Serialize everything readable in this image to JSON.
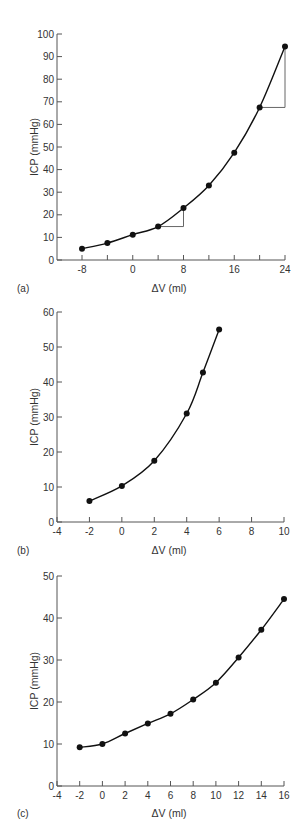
{
  "chart_data": [
    {
      "type": "line",
      "panel": "(a)",
      "title": "",
      "xlabel": "ΔV (ml)",
      "ylabel": "ICP (mmHg)",
      "xlim": [
        -12,
        24
      ],
      "ylim": [
        0,
        100
      ],
      "xticks": [
        -8,
        0,
        8,
        16,
        24
      ],
      "xticks_minor": [
        -8,
        -4,
        0,
        4,
        8,
        12,
        16,
        20,
        24
      ],
      "yticks": [
        0,
        10,
        20,
        30,
        40,
        50,
        60,
        70,
        80,
        90,
        100
      ],
      "grid": false,
      "series": [
        {
          "name": "ICP",
          "x": [
            -8,
            -4,
            0,
            4,
            8,
            12,
            16,
            20,
            24
          ],
          "y": [
            5,
            7.5,
            11.2,
            14.8,
            23,
            33,
            47.5,
            67.5,
            94.5
          ]
        }
      ],
      "annotations": [
        {
          "type": "triangle",
          "from": [
            4,
            14.8
          ],
          "to": [
            8,
            23
          ]
        },
        {
          "type": "triangle",
          "from": [
            20,
            67.5
          ],
          "to": [
            24,
            94.5
          ]
        }
      ]
    },
    {
      "type": "line",
      "panel": "(b)",
      "title": "",
      "xlabel": "ΔV (ml)",
      "ylabel": "ICP (mmHg)",
      "xlim": [
        -4,
        10
      ],
      "ylim": [
        0,
        60
      ],
      "xticks": [
        -4,
        -2,
        0,
        2,
        4,
        6,
        8,
        10
      ],
      "yticks": [
        0,
        10,
        20,
        30,
        40,
        50,
        60
      ],
      "grid": false,
      "series": [
        {
          "name": "ICP",
          "x": [
            -2,
            0,
            2,
            4,
            5,
            6
          ],
          "y": [
            6,
            10.3,
            17.5,
            31,
            42.7,
            55
          ]
        }
      ]
    },
    {
      "type": "line",
      "panel": "(c)",
      "title": "",
      "xlabel": "ΔV (ml)",
      "ylabel": "ICP (mmHg)",
      "xlim": [
        -4,
        16
      ],
      "ylim": [
        0,
        50
      ],
      "xticks": [
        -4,
        -2,
        0,
        2,
        4,
        6,
        8,
        10,
        12,
        14,
        16
      ],
      "yticks": [
        0,
        10,
        20,
        30,
        40,
        50
      ],
      "grid": false,
      "series": [
        {
          "name": "ICP",
          "x": [
            -2,
            0,
            2,
            4,
            6,
            8,
            10,
            12,
            14,
            16
          ],
          "y": [
            9.2,
            10,
            12.5,
            14.9,
            17.2,
            20.6,
            24.6,
            30.6,
            37.2,
            44.5
          ]
        }
      ]
    }
  ],
  "panels": {
    "a": {
      "label": "(a)",
      "xlabel": "ΔV (ml)",
      "ylabel": "ICP (mmHg)"
    },
    "b": {
      "label": "(b)",
      "xlabel": "ΔV (ml)",
      "ylabel": "ICP (mmHg)"
    },
    "c": {
      "label": "(c)",
      "xlabel": "ΔV (ml)",
      "ylabel": "ICP (mmHg)"
    }
  },
  "colors": {
    "line": "#111111",
    "axis": "#555555",
    "helper": "#666666",
    "text": "#333333"
  }
}
